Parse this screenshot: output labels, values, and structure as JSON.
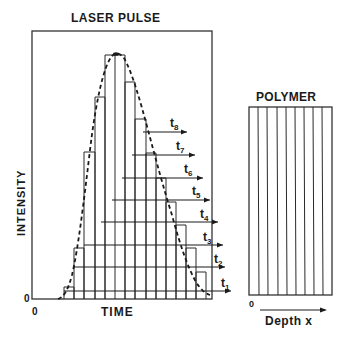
{
  "pulse_panel": {
    "title": "LASER PULSE",
    "y_axis_label": "INTENSITY",
    "x_axis_label": "TIME",
    "y_origin_label": "0",
    "x_origin_label": "0",
    "time_labels": [
      {
        "main": "t",
        "sub": "1"
      },
      {
        "main": "t",
        "sub": "2"
      },
      {
        "main": "t",
        "sub": "3"
      },
      {
        "main": "t",
        "sub": "4"
      },
      {
        "main": "t",
        "sub": "5"
      },
      {
        "main": "t",
        "sub": "6"
      },
      {
        "main": "t",
        "sub": "7"
      },
      {
        "main": "t",
        "sub": "8"
      }
    ],
    "curve_style": "dashed gaussian envelope over step histogram",
    "step_count": 15
  },
  "polymer_panel": {
    "title": "POLYMER",
    "origin_label": "0",
    "axis_label": "Depth x",
    "layer_count": 9
  },
  "colors": {
    "ink": "#1a1a1a",
    "background": "#ffffff"
  }
}
